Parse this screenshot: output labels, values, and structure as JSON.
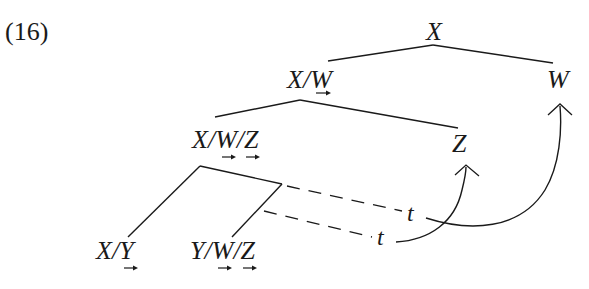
{
  "example_number": "(16)",
  "nodes": {
    "root": {
      "label": "X"
    },
    "left1": {
      "label_parts": [
        "X",
        "/",
        "W"
      ],
      "arrows_under": [
        "W"
      ]
    },
    "right1": {
      "label": "W"
    },
    "left2": {
      "label_parts": [
        "X",
        "/",
        "W",
        "/",
        "Z"
      ],
      "arrows_under": [
        "W",
        "Z"
      ]
    },
    "right2": {
      "label": "Z"
    },
    "leaf_a": {
      "label_parts": [
        "X",
        "/",
        "Y"
      ],
      "arrows_under": [
        "Y"
      ]
    },
    "leaf_b": {
      "label_parts": [
        "Y",
        "/",
        "W",
        "/",
        "Z"
      ],
      "arrows_under": [
        "W",
        "Z"
      ]
    }
  },
  "traces": [
    {
      "label": "t",
      "moves_to": "W"
    },
    {
      "label": "t",
      "moves_to": "Z"
    }
  ],
  "colors": {
    "ink": "#1a1a1a",
    "background": "#ffffff"
  }
}
